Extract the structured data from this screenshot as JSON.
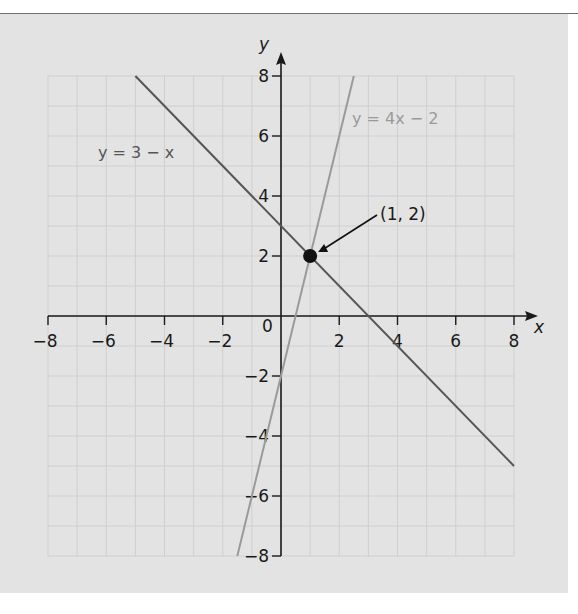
{
  "chart_data": {
    "type": "line",
    "title": "",
    "xlabel": "x",
    "ylabel": "y",
    "xlim": [
      -8,
      8
    ],
    "ylim": [
      -8,
      8
    ],
    "grid": true,
    "x_ticks": [
      -8,
      -6,
      -4,
      -2,
      0,
      2,
      4,
      6,
      8
    ],
    "y_ticks": [
      -8,
      -6,
      -4,
      -2,
      2,
      4,
      6,
      8
    ],
    "x_tick_labels": [
      "−8",
      "−6",
      "−4",
      "−2",
      "2",
      "4",
      "6",
      "8"
    ],
    "y_tick_labels": [
      "8",
      "6",
      "4",
      "2",
      "−2",
      "−4",
      "−6",
      "−8"
    ],
    "origin_label": "0",
    "series": [
      {
        "name": "y = 3 − x",
        "equation": "y = 3 - x",
        "x": [
          -5,
          8
        ],
        "y": [
          8,
          -5
        ],
        "color": "#555555"
      },
      {
        "name": "y = 4x − 2",
        "equation": "y = 4x - 2",
        "x": [
          -1.5,
          2.5
        ],
        "y": [
          -8,
          8
        ],
        "color": "#9a9a9a"
      }
    ],
    "annotations": [
      {
        "text": "(1, 2)",
        "point": [
          1,
          2
        ],
        "type": "intersection",
        "arrow": true
      }
    ],
    "legend": "inline labels"
  },
  "labels": {
    "x_axis": "x",
    "y_axis": "y",
    "origin": "0",
    "line1": "y = 3 − x",
    "line2": "y = 4x − 2",
    "intersection": "(1, 2)"
  },
  "colors": {
    "background": "#e3e3e3",
    "grid": "#cfcfcf",
    "axis": "#1a1a1a",
    "line1": "#555555",
    "line2": "#9a9a9a"
  }
}
